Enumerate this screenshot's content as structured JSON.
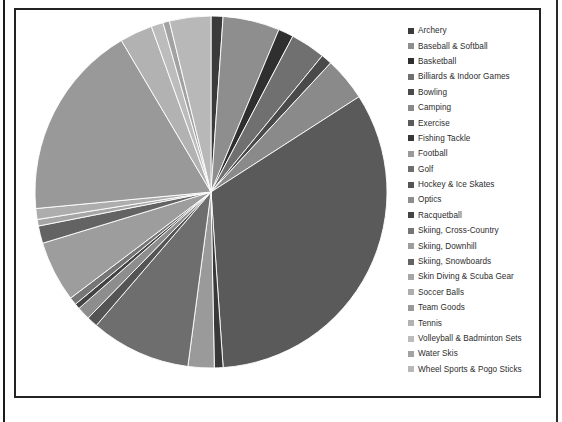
{
  "chart_data": {
    "type": "pie",
    "title": "",
    "legend_position": "right",
    "grid": false,
    "categories": [
      "Archery",
      "Baseball & Softball",
      "Basketball",
      "Billiards & Indoor Games",
      "Bowling",
      "Camping",
      "Exercise",
      "Fishing Tackle",
      "Football",
      "Golf",
      "Hockey & Ice Skates",
      "Optics",
      "Racquetball",
      "Skiing, Cross-Country",
      "Skiing, Downhill",
      "Skiing, Snowboards",
      "Skin Diving & Scuba Gear",
      "Soccer Balls",
      "Team Goods",
      "Tennis",
      "Volleyball & Badminton Sets",
      "Water Skis",
      "Wheel Sports & Pogo Sticks"
    ],
    "values": [
      1.1,
      5.2,
      1.4,
      3.2,
      1.0,
      4.0,
      33.0,
      0.8,
      2.4,
      9.2,
      1.0,
      1.2,
      0.5,
      0.7,
      5.6,
      1.6,
      0.6,
      1.0,
      18.0,
      3.0,
      1.1,
      0.6,
      3.8
    ],
    "colors": [
      "#3b3b3b",
      "#8e8e8e",
      "#2f2f2f",
      "#707070",
      "#4a4a4a",
      "#8a8a8a",
      "#5a5a5a",
      "#383838",
      "#9a9a9a",
      "#6e6e6e",
      "#545454",
      "#8d8d8d",
      "#444444",
      "#767676",
      "#9d9d9d",
      "#636363",
      "#a6a6a6",
      "#adadad",
      "#999999",
      "#b2b2b2",
      "#bcbcbc",
      "#a2a2a2",
      "#b8b8b8"
    ],
    "start_angle_deg": 0,
    "direction": "clockwise",
    "ylim": null,
    "xlabel": "",
    "ylabel": ""
  },
  "legend": {
    "items": [
      {
        "label": "Archery",
        "color": "#3b3b3b"
      },
      {
        "label": "Baseball & Softball",
        "color": "#8e8e8e"
      },
      {
        "label": "Basketball",
        "color": "#2f2f2f"
      },
      {
        "label": "Billiards & Indoor Games",
        "color": "#707070"
      },
      {
        "label": "Bowling",
        "color": "#4a4a4a"
      },
      {
        "label": "Camping",
        "color": "#8a8a8a"
      },
      {
        "label": "Exercise",
        "color": "#5a5a5a"
      },
      {
        "label": "Fishing Tackle",
        "color": "#383838"
      },
      {
        "label": "Football",
        "color": "#9a9a9a"
      },
      {
        "label": "Golf",
        "color": "#6e6e6e"
      },
      {
        "label": "Hockey & Ice Skates",
        "color": "#545454"
      },
      {
        "label": "Optics",
        "color": "#8d8d8d"
      },
      {
        "label": "Racquetball",
        "color": "#444444"
      },
      {
        "label": "Skiing, Cross-Country",
        "color": "#767676"
      },
      {
        "label": "Skiing, Downhill",
        "color": "#9d9d9d"
      },
      {
        "label": "Skiing, Snowboards",
        "color": "#636363"
      },
      {
        "label": "Skin Diving & Scuba Gear",
        "color": "#a6a6a6"
      },
      {
        "label": "Soccer Balls",
        "color": "#adadad"
      },
      {
        "label": "Team Goods",
        "color": "#999999"
      },
      {
        "label": "Tennis",
        "color": "#b2b2b2"
      },
      {
        "label": "Volleyball & Badminton Sets",
        "color": "#bcbcbc"
      },
      {
        "label": "Water Skis",
        "color": "#a2a2a2"
      },
      {
        "label": "Wheel Sports & Pogo Sticks",
        "color": "#b8b8b8"
      }
    ]
  }
}
